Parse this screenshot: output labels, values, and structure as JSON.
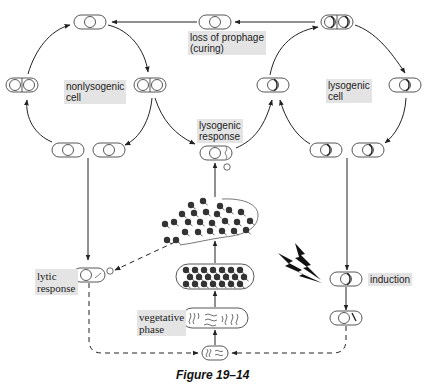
{
  "diagram": {
    "labels": {
      "nonlysogenic_cell": "nonlysogenic\ncell",
      "loss_of_prophage": "loss of prophage\n(curing)",
      "lysogenic_cell": "lysogenic\ncell",
      "lysogenic_response": "lysogenic\nresponse",
      "lytic_response": "lytic\nresponse",
      "vegetative_phase": "vegetative\nphase",
      "induction": "induction"
    },
    "caption": "Figure 19–14",
    "colors": {
      "line": "#222222",
      "label_bg": "#e4e4e4",
      "phage": "#333333"
    }
  }
}
